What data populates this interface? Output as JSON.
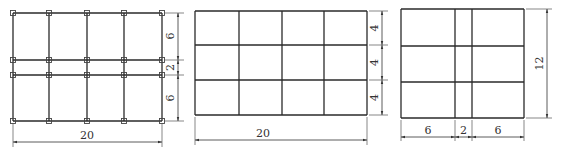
{
  "figures": [
    {
      "id": "a",
      "description": "4x3 grid with nodes, rows 6-2-6, width 20",
      "bbox": {
        "x": 13,
        "y": 13,
        "w": 149,
        "h": 108
      },
      "columns_x": [
        13,
        49,
        87,
        124,
        162
      ],
      "rows_y": [
        13,
        60,
        75,
        121
      ],
      "nodes": true,
      "width_dim": {
        "label": "20",
        "y": 142
      },
      "height_dims": [
        {
          "label": "6",
          "y1": 13,
          "y2": 60
        },
        {
          "label": "2",
          "y1": 60,
          "y2": 75
        },
        {
          "label": "6",
          "y1": 75,
          "y2": 121
        }
      ],
      "height_dim_x": 178
    },
    {
      "id": "b",
      "description": "4x3 grid, rows 4-4-4, width 20",
      "bbox": {
        "x": 195,
        "y": 11,
        "w": 172,
        "h": 104
      },
      "columns_x": [
        195,
        239,
        282,
        324,
        367
      ],
      "rows_y": [
        11,
        45,
        80,
        115
      ],
      "nodes": false,
      "width_dim": {
        "label": "20",
        "y": 140
      },
      "height_dims": [
        {
          "label": "4",
          "y1": 11,
          "y2": 45
        },
        {
          "label": "4",
          "y1": 45,
          "y2": 80
        },
        {
          "label": "4",
          "y1": 80,
          "y2": 115
        }
      ],
      "height_dim_x": 382
    },
    {
      "id": "c",
      "description": "3x3 grid, columns 6-2-6, height 12",
      "bbox": {
        "x": 401,
        "y": 9,
        "w": 123,
        "h": 109
      },
      "columns_x": [
        401,
        455,
        472,
        524
      ],
      "rows_y": [
        9,
        46,
        82,
        118
      ],
      "nodes": false,
      "width_dims": [
        {
          "label": "6",
          "x1": 401,
          "x2": 455
        },
        {
          "label": "2",
          "x1": 455,
          "x2": 472
        },
        {
          "label": "6",
          "x1": 472,
          "x2": 524
        }
      ],
      "width_dim_y": 137,
      "height_dim": {
        "label": "12",
        "x": 547
      }
    }
  ],
  "labels": {
    "a_width": "20",
    "a_h1": "6",
    "a_h2": "2",
    "a_h3": "6",
    "b_width": "20",
    "b_h1": "4",
    "b_h2": "4",
    "b_h3": "4",
    "c_w1": "6",
    "c_w2": "2",
    "c_w3": "6",
    "c_height": "12"
  }
}
